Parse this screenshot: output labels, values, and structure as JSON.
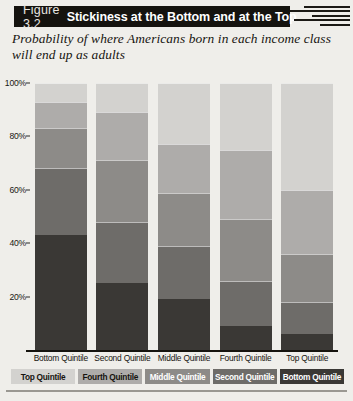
{
  "figure": {
    "number_label": "Figure 3.2",
    "title": "Stickiness at the Bottom and at the Top",
    "subtitle": "Probability of where Americans born in each income class will end up as adults",
    "source_note": ""
  },
  "colors": {
    "page_background": "#efeeea",
    "title_bar": "#15130f",
    "title_text": "#ffffff",
    "axis_text": "#16140f",
    "bottom_quintile": "#3a3835",
    "second_quintile": "#6e6c69",
    "middle_quintile": "#8d8b88",
    "fourth_quintile": "#aeacaa",
    "top_quintile": "#d3d2cf"
  },
  "chart_data": {
    "type": "bar",
    "stacked": true,
    "title": "Stickiness at the Bottom and at the Top",
    "subtitle": "Probability of where Americans born in each income class will end up as adults",
    "xlabel": "",
    "ylabel": "",
    "ylim": [
      0,
      100
    ],
    "ytick_labels": [
      "20%",
      "40%",
      "60%",
      "80%",
      "100%"
    ],
    "ytick_values": [
      20,
      40,
      60,
      80,
      100
    ],
    "grid": false,
    "legend_position": "bottom",
    "categories": [
      "Bottom Quintile",
      "Second Quintile",
      "Middle Quintile",
      "Fourth Quintile",
      "Top Quintile"
    ],
    "series": [
      {
        "name": "Bottom Quintile",
        "color": "#3a3835",
        "values": [
          43,
          25,
          19,
          9,
          6
        ]
      },
      {
        "name": "Second Quintile",
        "color": "#6e6c69",
        "values": [
          25,
          23,
          20,
          17,
          12
        ]
      },
      {
        "name": "Middle Quintile",
        "color": "#8d8b88",
        "values": [
          15,
          23,
          20,
          23,
          18
        ]
      },
      {
        "name": "Fourth Quintile",
        "color": "#aeacaa",
        "values": [
          10,
          18,
          18,
          26,
          24
        ]
      },
      {
        "name": "Top Quintile",
        "color": "#d3d2cf",
        "values": [
          7,
          11,
          23,
          25,
          40
        ]
      }
    ],
    "legend_entries": [
      {
        "label": "Top Quintile",
        "color": "#d3d2cf",
        "text_color": "#16140f"
      },
      {
        "label": "Fourth Quintile",
        "color": "#aeacaa",
        "text_color": "#16140f"
      },
      {
        "label": "Middle Quintile",
        "color": "#8d8b88",
        "text_color": "#ffffff"
      },
      {
        "label": "Second Quintile",
        "color": "#6e6c69",
        "text_color": "#ffffff"
      },
      {
        "label": "Bottom Quintile",
        "color": "#3a3835",
        "text_color": "#ffffff"
      }
    ]
  }
}
